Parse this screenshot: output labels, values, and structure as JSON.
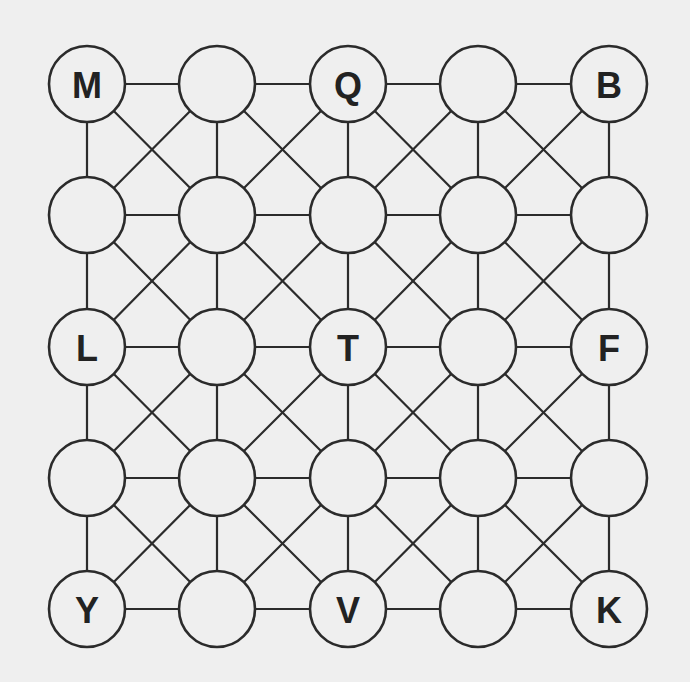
{
  "puzzle": {
    "type": "5x5 letter grid with king-move connections",
    "rows": 5,
    "cols": 5,
    "grid": [
      [
        "M",
        "",
        "Q",
        "",
        "B"
      ],
      [
        "",
        "",
        "",
        "",
        ""
      ],
      [
        "L",
        "",
        "T",
        "",
        "F"
      ],
      [
        "",
        "",
        "",
        "",
        ""
      ],
      [
        "Y",
        "",
        "V",
        "",
        "K"
      ]
    ],
    "connections": "orthogonal neighbors plus both diagonals in every cell",
    "node_radius": 38,
    "x_positions": [
      87,
      217,
      348,
      478,
      609
    ],
    "y_positions": [
      84,
      215,
      347,
      478,
      609
    ]
  },
  "colors": {
    "background": "#efefef",
    "line": "#2b2b2b",
    "text": "#222222"
  }
}
